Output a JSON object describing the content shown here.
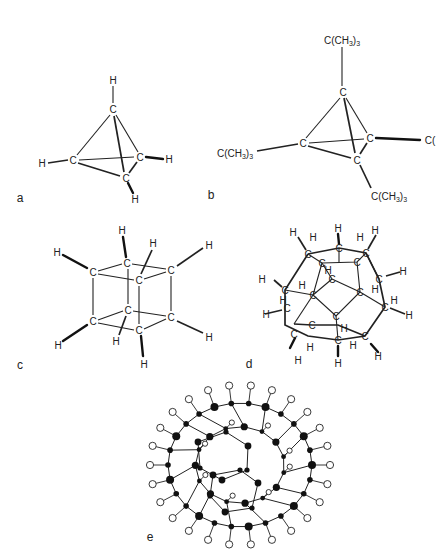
{
  "figure": {
    "panels": [
      {
        "id": "a",
        "label": "a",
        "molecule": "tetrahedrane",
        "atoms": {
          "carbon": "C",
          "hydrogen": "H"
        }
      },
      {
        "id": "b",
        "label": "b",
        "molecule": "tetra-tert-butyltetrahedrane",
        "substituent": "C(CH3)3",
        "substituent_main": "C(CH",
        "substituent_sub1": "3",
        "substituent_close": ")",
        "substituent_sub2": "3",
        "truncated_substituent": "C("
      },
      {
        "id": "c",
        "label": "c",
        "molecule": "cubane"
      },
      {
        "id": "d",
        "label": "d",
        "molecule": "dodecahedrane"
      },
      {
        "id": "e",
        "label": "e",
        "molecule": "fullerene hydride (C60H60-like ball-and-stick)"
      }
    ],
    "atom_symbols": {
      "carbon": "C",
      "hydrogen": "H"
    }
  }
}
